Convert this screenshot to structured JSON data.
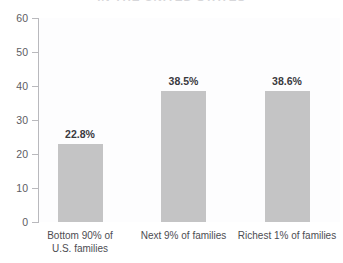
{
  "chart_data": {
    "type": "bar",
    "title": "IN THE UNITED STATES",
    "xlabel": "",
    "ylabel": "",
    "ylim": [
      0,
      60
    ],
    "yticks": [
      0,
      10,
      20,
      30,
      40,
      50,
      60
    ],
    "grid": false,
    "legend": false,
    "categories": [
      "Bottom 90% of U.S. families",
      "Next 9% of families",
      "Richest 1% of families"
    ],
    "category_lines": [
      [
        "Bottom 90% of",
        "U.S. families"
      ],
      [
        "Next 9% of families"
      ],
      [
        "Richest 1% of families"
      ]
    ],
    "values": [
      22.8,
      38.5,
      38.6
    ],
    "data_labels": [
      "22.8%",
      "38.5%",
      "38.6%"
    ],
    "colors": {
      "bar_fill": "#c4c4c5",
      "axis": "#b9b9bd",
      "tick_text": "#5d5d63",
      "value_text": "#3a3a3e",
      "category_text": "#4d4d52",
      "title_text": "#d7d7da",
      "background": "#ffffff"
    }
  }
}
